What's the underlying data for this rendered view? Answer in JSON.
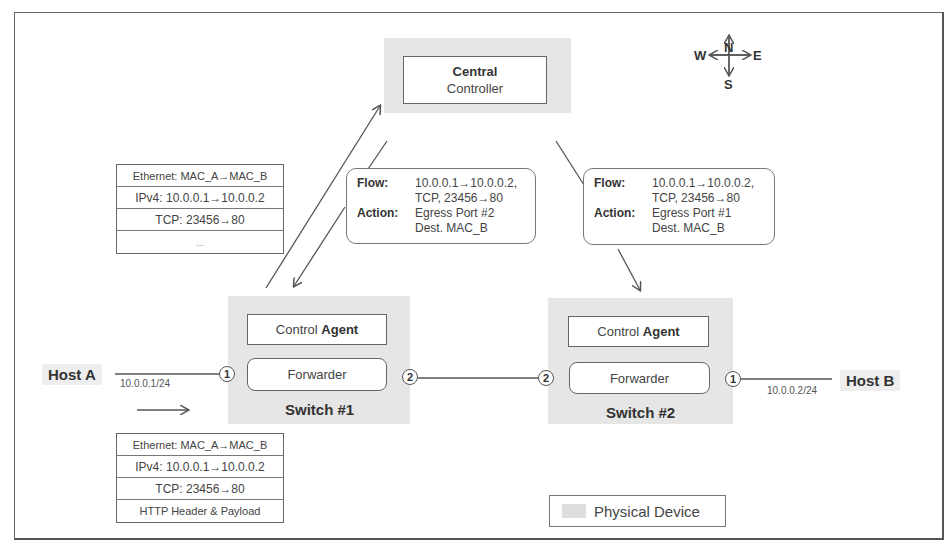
{
  "controller": {
    "line1": "Central",
    "line2": "Controller"
  },
  "compass": {
    "n": "N",
    "s": "S",
    "e": "E",
    "w": "W"
  },
  "packet_top": {
    "rows": [
      "Ethernet: MAC_A→MAC_B",
      "IPv4: 10.0.0.1→10.0.0.2",
      "TCP: 23456→80",
      "..."
    ]
  },
  "packet_bottom": {
    "rows": [
      "Ethernet: MAC_A→MAC_B",
      "IPv4: 10.0.0.1→10.0.0.2",
      "TCP: 23456→80",
      "HTTP Header & Payload"
    ]
  },
  "flow1": {
    "flow_key": "Flow:",
    "flow_v1": "10.0.0.1→10.0.0.2,",
    "flow_v2": "TCP, 23456→80",
    "action_key": "Action:",
    "action_v1": "Egress Port #2",
    "action_v2": "Dest. MAC_B"
  },
  "flow2": {
    "flow_key": "Flow:",
    "flow_v1": "10.0.0.1→10.0.0.2,",
    "flow_v2": "TCP, 23456→80",
    "action_key": "Action:",
    "action_v1": "Egress Port #1",
    "action_v2": "Dest. MAC_B"
  },
  "switch1": {
    "agent_plain": "Control ",
    "agent_bold": "Agent",
    "forwarder": "Forwarder",
    "label": "Switch #1",
    "port_left": "1",
    "port_right": "2"
  },
  "switch2": {
    "agent_plain": "Control ",
    "agent_bold": "Agent",
    "forwarder": "Forwarder",
    "label": "Switch #2",
    "port_left": "2",
    "port_right": "1"
  },
  "host_a": {
    "name": "Host A",
    "ip": "10.0.0.1/24"
  },
  "host_b": {
    "name": "Host B",
    "ip": "10.0.0.2/24"
  },
  "legend": {
    "label": "Physical Device"
  }
}
